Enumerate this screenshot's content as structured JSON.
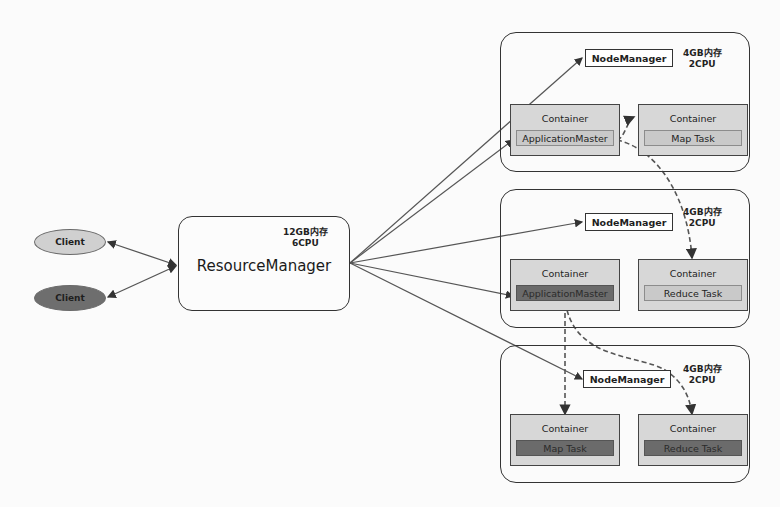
{
  "clients": [
    {
      "label": "Client",
      "fill": "#d0d0d0"
    },
    {
      "label": "Client",
      "fill": "#6e6e6e"
    }
  ],
  "resource_manager": {
    "title": "ResourceManager",
    "memory": "12GB内存",
    "cpu": "6CPU"
  },
  "nodes": [
    {
      "node_manager": "NodeManager",
      "memory": "4GB内存",
      "cpu": "2CPU",
      "containers": [
        {
          "title": "Container",
          "task": "ApplicationMaster",
          "task_style": "light"
        },
        {
          "title": "Container",
          "task": "Map Task",
          "task_style": "light"
        }
      ]
    },
    {
      "node_manager": "NodeManager",
      "memory": "4GB内存",
      "cpu": "2CPU",
      "containers": [
        {
          "title": "Container",
          "task": "ApplicationMaster",
          "task_style": "dark"
        },
        {
          "title": "Container",
          "task": "Reduce Task",
          "task_style": "light"
        }
      ]
    },
    {
      "node_manager": "NodeManager",
      "memory": "4GB内存",
      "cpu": "2CPU",
      "containers": [
        {
          "title": "Container",
          "task": "Map Task",
          "task_style": "dark"
        },
        {
          "title": "Container",
          "task": "Reduce Task",
          "task_style": "dark"
        }
      ]
    }
  ],
  "colors": {
    "container_fill": "#d7d7d7",
    "light_task_fill": "#c9c9c9",
    "dark_task_fill": "#6b6b6b",
    "line": "#444444"
  }
}
